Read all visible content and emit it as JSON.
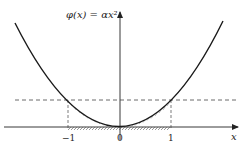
{
  "figure": {
    "function_label": "φ(x) = αx²",
    "x_axis_label": "x",
    "ticks": [
      {
        "value": -1,
        "label": "−1"
      },
      {
        "value": 0,
        "label": "0"
      },
      {
        "value": 1,
        "label": "1"
      }
    ],
    "curve": "parabola",
    "threshold_line": "dashed horizontal at φ(±1)",
    "hatched_region": "interval [−1, 1] on x-axis and curve segment between −1 and 1"
  },
  "colors": {
    "curve": "#1a1a1a",
    "axes": "#222222",
    "dashed": "#444444",
    "hatch": "#555555"
  }
}
